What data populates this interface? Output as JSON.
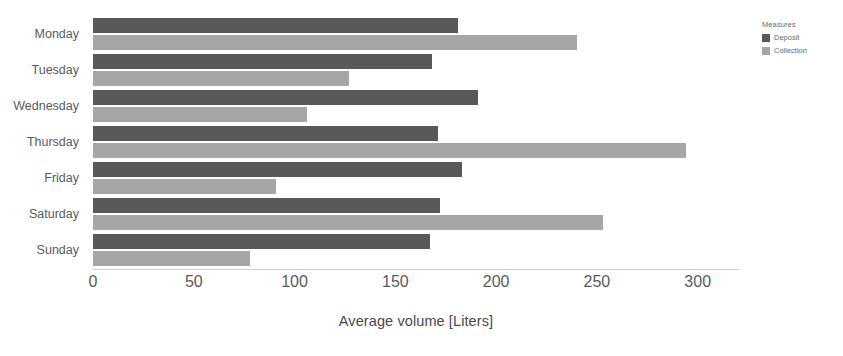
{
  "chart_data": {
    "type": "bar",
    "orientation": "horizontal",
    "title": "",
    "xlabel": "Average volume [Liters]",
    "ylabel": "",
    "categories": [
      "Monday",
      "Tuesday",
      "Wednesday",
      "Thursday",
      "Friday",
      "Saturday",
      "Sunday"
    ],
    "series": [
      {
        "name": "Deposit",
        "color": "#595959",
        "values": [
          181,
          168,
          191,
          171,
          183,
          172,
          167
        ]
      },
      {
        "name": "Collection",
        "color": "#a6a6a6",
        "values": [
          240,
          127,
          106,
          294,
          91,
          253,
          78
        ]
      }
    ],
    "xlim": [
      0,
      320
    ],
    "xticks": [
      0,
      50,
      100,
      150,
      200,
      250,
      300
    ],
    "xtick_labels": [
      "0",
      "50",
      "100",
      "150",
      "200",
      "250",
      "300"
    ],
    "grid": false,
    "legend_position": "right"
  },
  "legend": {
    "title": "Measures",
    "items": [
      {
        "label": "Deposit",
        "color": "#595959"
      },
      {
        "label": "Collection",
        "color": "#a6a6a6"
      }
    ]
  },
  "colors": {
    "background": "#ffffff",
    "deposit": "#595959",
    "collection": "#a6a6a6",
    "text": "#5a5a5a",
    "axis": "#d0d0d0"
  }
}
